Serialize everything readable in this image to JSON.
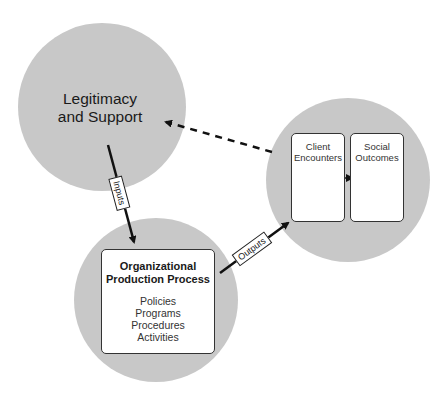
{
  "diagram": {
    "nodes": {
      "legitimacy": {
        "label_line1": "Legitimacy",
        "label_line2": "and Support"
      },
      "production": {
        "title_line1": "Organizational",
        "title_line2": "Production Process",
        "items": [
          "Policies",
          "Programs",
          "Procedures",
          "Activities"
        ]
      },
      "client": {
        "label_line1": "Client",
        "label_line2": "Encounters"
      },
      "social": {
        "label_line1": "Social",
        "label_line2": "Outcomes"
      }
    },
    "edges": {
      "inputs": {
        "label": "Inputs",
        "from": "legitimacy",
        "to": "production",
        "style": "solid"
      },
      "outputs": {
        "label": "Outputs",
        "from": "production",
        "to": "client",
        "style": "solid"
      },
      "feedback": {
        "label": "",
        "from": "client-outcomes",
        "to": "legitimacy",
        "style": "dashed"
      }
    },
    "colors": {
      "circle_fill": "#c8c8c8",
      "arrow": "#111111",
      "box_fill": "#ffffff"
    }
  }
}
